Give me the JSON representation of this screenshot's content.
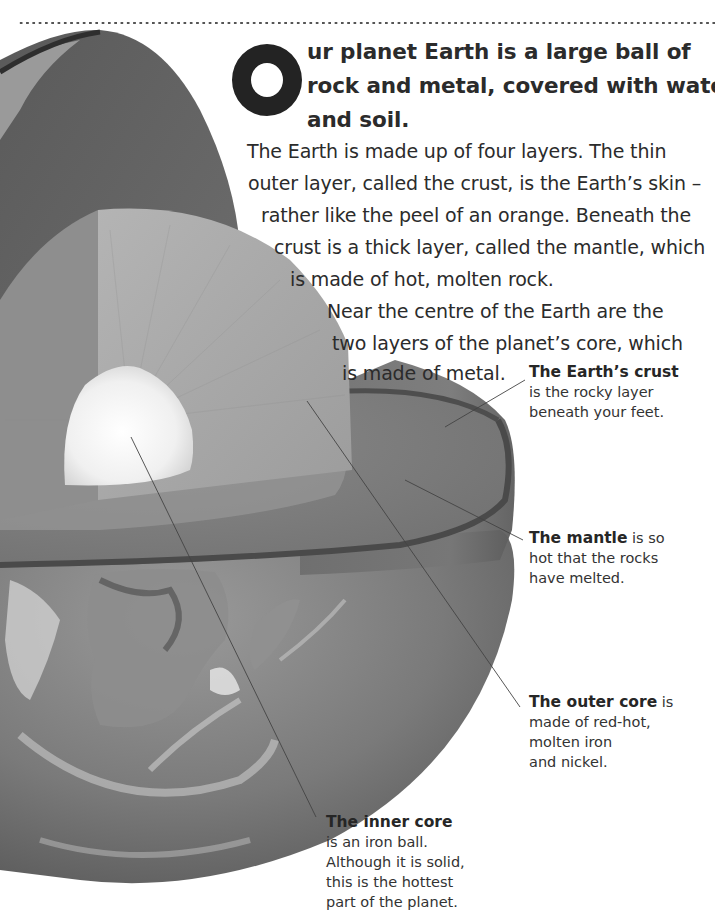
{
  "page": {
    "decoration": "dotted-rule"
  },
  "intro": {
    "drop_cap": "O",
    "lead_lines": [
      "ur planet Earth is a large ball of",
      "rock and metal, covered with water",
      "and soil."
    ],
    "body_lines": [
      "The Earth is made up of four layers. The thin",
      "outer layer, called the crust, is the Earth’s skin –",
      "rather like the peel of an orange. Beneath the",
      "crust is a thick layer, called the mantle, which",
      "is made of hot, molten rock.",
      "Near the centre of the Earth are the",
      "two layers of the planet’s core, which",
      "is made of metal."
    ]
  },
  "illustration": {
    "subject": "cutaway-earth-layers",
    "colors": {
      "crust_dark": "#3e3e3e",
      "mantle": "#6a6a6a",
      "outer_core": "#a8a8a8",
      "inner_core": "#f4f4f4",
      "ocean": "#7a7a7a",
      "leader_line": "#444444"
    }
  },
  "callouts": [
    {
      "id": "crust",
      "title": "The Earth’s crust",
      "lines": [
        "is the rocky layer",
        "beneath your feet."
      ]
    },
    {
      "id": "mantle",
      "title": "The mantle",
      "title_suffix": " is so",
      "lines": [
        "hot that the rocks",
        "have melted."
      ]
    },
    {
      "id": "outer-core",
      "title": "The outer core",
      "title_suffix": " is",
      "lines": [
        "made of red-hot,",
        "molten iron",
        "and nickel."
      ]
    },
    {
      "id": "inner-core",
      "title": "The inner core",
      "lines": [
        "is an iron ball.",
        "Although it is solid,",
        "this is the hottest",
        "part of the planet."
      ]
    }
  ]
}
